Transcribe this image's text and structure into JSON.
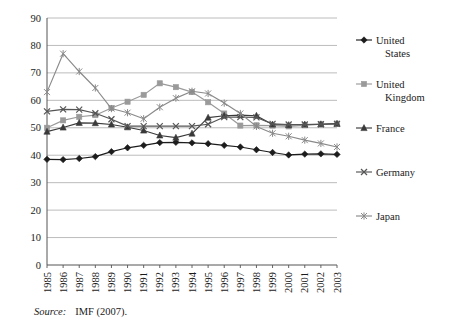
{
  "figure": {
    "caption_label": "Source:",
    "caption_text": "IMF (2007)."
  },
  "axes": {
    "y_ticks": [
      "0",
      "10",
      "20",
      "30",
      "40",
      "50",
      "60",
      "70",
      "80",
      "90"
    ],
    "x_ticks": [
      "1985",
      "1986",
      "1987",
      "1988",
      "1989",
      "1990",
      "1991",
      "1992",
      "1993",
      "1994",
      "1995",
      "1996",
      "1997",
      "1998",
      "1999",
      "2000",
      "2001",
      "2002",
      "2003"
    ]
  },
  "legend": {
    "position": "right",
    "items": [
      {
        "label": "United States",
        "marker": "diamond",
        "color": "#1c1c1c"
      },
      {
        "label": "United Kingdom",
        "marker": "square",
        "color": "#9a9a9a"
      },
      {
        "label": "France",
        "marker": "triangle",
        "color": "#3a3a3a"
      },
      {
        "label": "Germany",
        "marker": "cross",
        "color": "#555555"
      },
      {
        "label": "Japan",
        "marker": "asterisk",
        "color": "#8a8a8a"
      }
    ]
  },
  "chart_data": {
    "type": "line",
    "title": "",
    "xlabel": "",
    "ylabel": "",
    "ylim": [
      0,
      90
    ],
    "ytick_step": 10,
    "grid": true,
    "legend_position": "right",
    "x": [
      "1985",
      "1986",
      "1987",
      "1988",
      "1989",
      "1990",
      "1991",
      "1992",
      "1993",
      "1994",
      "1995",
      "1996",
      "1997",
      "1998",
      "1999",
      "2000",
      "2001",
      "2002",
      "2003"
    ],
    "series": [
      {
        "name": "United States",
        "marker": "diamond",
        "color": "#1c1c1c",
        "values": [
          38.5,
          38.4,
          38.8,
          39.5,
          41.3,
          42.7,
          43.6,
          44.6,
          44.7,
          44.5,
          44.2,
          43.6,
          43.0,
          42.0,
          41.0,
          40.1,
          40.4,
          40.5,
          40.3
        ]
      },
      {
        "name": "United Kingdom",
        "marker": "square",
        "color": "#9a9a9a",
        "values": [
          50.0,
          52.7,
          54.0,
          54.6,
          57.2,
          59.5,
          62.0,
          66.2,
          64.8,
          63.0,
          59.3,
          55.2,
          50.8,
          50.9,
          50.8,
          50.5,
          50.9,
          51.3,
          51.5
        ]
      },
      {
        "name": "France",
        "marker": "triangle",
        "color": "#3a3a3a",
        "values": [
          48.6,
          50.1,
          51.8,
          51.7,
          51.2,
          50.2,
          49.0,
          47.2,
          46.4,
          47.9,
          53.7,
          54.4,
          54.6,
          54.4,
          51.2,
          51.0,
          51.2,
          51.3,
          51.5
        ]
      },
      {
        "name": "Germany",
        "marker": "cross",
        "color": "#555555",
        "values": [
          56.0,
          56.7,
          56.6,
          55.3,
          53.1,
          50.6,
          50.6,
          50.6,
          50.6,
          50.6,
          51.3,
          53.9,
          53.9,
          53.8,
          51.4,
          51.2,
          51.2,
          51.3,
          51.4
        ]
      },
      {
        "name": "Japan",
        "marker": "asterisk",
        "color": "#8a8a8a",
        "values": [
          63.0,
          77.0,
          70.5,
          64.5,
          57.0,
          55.5,
          53.3,
          57.5,
          60.8,
          63.3,
          62.5,
          59.0,
          55.2,
          50.5,
          48.0,
          46.9,
          45.5,
          44.3,
          43.0
        ]
      }
    ]
  }
}
